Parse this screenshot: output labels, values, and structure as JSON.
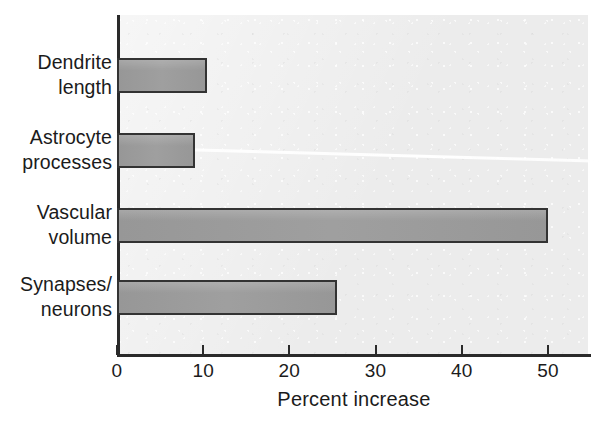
{
  "chart_data": {
    "type": "bar",
    "orientation": "horizontal",
    "title": "",
    "xlabel": "Percent increase",
    "ylabel": "",
    "categories": [
      "Dendrite\nlength",
      "Astrocyte\nprocesses",
      "Vascular\nvolume",
      "Synapses/\nneurons"
    ],
    "values": [
      10.5,
      9,
      50,
      25.5
    ],
    "xlim": [
      0,
      55
    ],
    "xticks": [
      0,
      10,
      20,
      30,
      40,
      50
    ],
    "xtick_labels": [
      "0",
      "10",
      "20",
      "30",
      "40",
      "50"
    ],
    "grid": false,
    "legend": null,
    "series": [
      {
        "name": "Percent increase",
        "values": [
          10.5,
          9,
          50,
          25.5
        ]
      }
    ],
    "colors": {
      "bar_fill": "#9a9a9a",
      "bar_edge": "#333333",
      "panel_background": "#ececec",
      "axis": "#2a2a2a",
      "text": "#1b1b1b",
      "page_background": "#ffffff"
    }
  }
}
